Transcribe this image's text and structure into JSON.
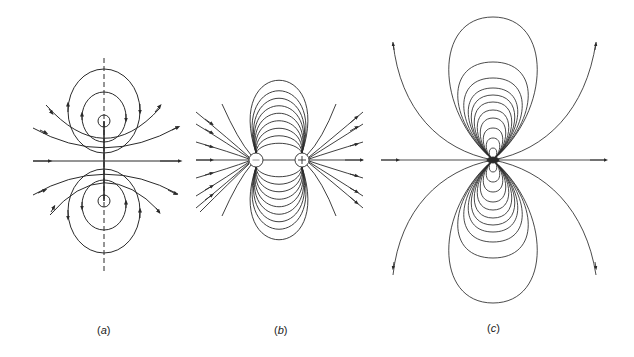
{
  "figure": {
    "panels": [
      {
        "id": "a",
        "label": "(a)",
        "description": "Magnetic field lines of a current loop (cross-section) with dashed axis",
        "center": [
          104,
          161
        ],
        "label_pos": [
          97,
          324
        ]
      },
      {
        "id": "b",
        "label": "(b)",
        "description": "Electric field lines of a dipole: negative charge and positive charge",
        "charges": [
          {
            "sign": "-",
            "symbol": "−",
            "x": 256,
            "y": 160
          },
          {
            "sign": "+",
            "symbol": "+",
            "x": 302,
            "y": 160
          }
        ],
        "label_pos": [
          274,
          324
        ]
      },
      {
        "id": "c",
        "label": "(c)",
        "description": "Field lines of a point dipole",
        "center": [
          493,
          160
        ],
        "label_pos": [
          487,
          322
        ]
      }
    ],
    "stroke_color": "#2a2a2a"
  }
}
